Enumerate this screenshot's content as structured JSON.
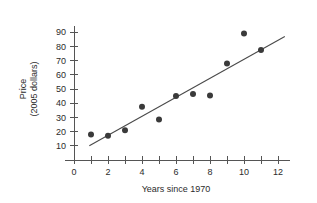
{
  "chart_data": {
    "type": "scatter",
    "title": "",
    "xlabel": "Years since 1970",
    "ylabel_line1": "Price",
    "ylabel_line2": "(2005 dollars)",
    "xlim": [
      0,
      12.6
    ],
    "ylim": [
      0,
      95
    ],
    "grid": false,
    "legend": null,
    "x_tick_step": 1,
    "x_label_step": 2,
    "x_ticks": [
      0,
      1,
      2,
      3,
      4,
      5,
      6,
      7,
      8,
      9,
      10,
      11,
      12
    ],
    "x_tick_labels": [
      "0",
      "",
      "2",
      "",
      "4",
      "",
      "6",
      "",
      "8",
      "",
      "10",
      "",
      "12"
    ],
    "y_ticks": [
      10,
      20,
      30,
      40,
      50,
      60,
      70,
      80,
      90
    ],
    "y_tick_labels": [
      "10",
      "20",
      "30",
      "40",
      "50",
      "60",
      "70",
      "80",
      "90"
    ],
    "x": [
      1,
      2,
      3,
      4,
      5,
      6,
      7,
      8,
      9,
      10,
      11
    ],
    "values": [
      18,
      17,
      21,
      37.5,
      28.5,
      45,
      46.5,
      45.5,
      68,
      89,
      77.5
    ],
    "points": [
      {
        "x": 1,
        "y": 18
      },
      {
        "x": 2,
        "y": 17
      },
      {
        "x": 3,
        "y": 21
      },
      {
        "x": 4,
        "y": 37.5
      },
      {
        "x": 5,
        "y": 28.5
      },
      {
        "x": 6,
        "y": 45
      },
      {
        "x": 7,
        "y": 46.5
      },
      {
        "x": 8,
        "y": 45.5
      },
      {
        "x": 9,
        "y": 68
      },
      {
        "x": 10,
        "y": 89
      },
      {
        "x": 11,
        "y": 77.5
      }
    ],
    "trend_line": {
      "x0": 0.9,
      "y0": 10,
      "x1": 12.4,
      "y1": 87
    },
    "colors": {
      "point": "#3a3a3a",
      "line": "#4a4a4a",
      "axis": "#555555",
      "text": "#2b2b2b",
      "background": "#ffffff"
    }
  }
}
